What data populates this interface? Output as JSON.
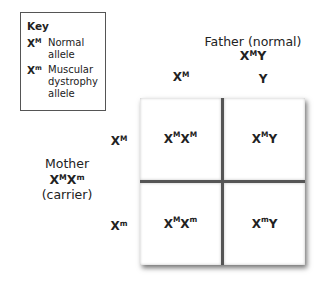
{
  "key": {
    "title": "Key",
    "items": [
      {
        "base": "X",
        "sup": "M",
        "desc": "Normal allele"
      },
      {
        "base": "X",
        "sup": "m",
        "desc": "Muscular dystrophy allele"
      }
    ]
  },
  "father": {
    "label": "Father (normal)",
    "genotype": {
      "a": "X",
      "a_sup": "M",
      "b": "Y"
    },
    "alleles": [
      {
        "base": "X",
        "sup": "M"
      },
      {
        "base": "Y",
        "sup": ""
      }
    ]
  },
  "mother": {
    "label": "Mother",
    "genotype": {
      "a": "X",
      "a_sup": "M",
      "b": "X",
      "b_sup": "m"
    },
    "status": "(carrier)",
    "alleles": [
      {
        "base": "X",
        "sup": "M"
      },
      {
        "base": "X",
        "sup": "m"
      }
    ]
  },
  "cells": [
    {
      "a": "X",
      "a_sup": "M",
      "b": "X",
      "b_sup": "M"
    },
    {
      "a": "X",
      "a_sup": "M",
      "b": "Y",
      "b_sup": ""
    },
    {
      "a": "X",
      "a_sup": "M",
      "b": "X",
      "b_sup": "m"
    },
    {
      "a": "X",
      "a_sup": "m",
      "b": "Y",
      "b_sup": ""
    }
  ]
}
